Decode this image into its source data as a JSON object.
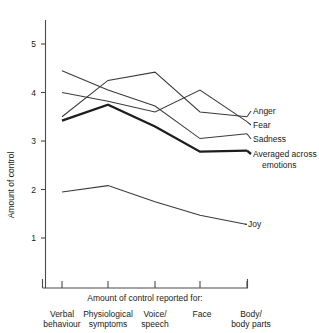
{
  "chart_data": {
    "type": "line",
    "title": "",
    "xlabel": "Amount of control reported for:",
    "ylabel": "Amount of control",
    "categories": [
      "Verbal behaviour",
      "Physiological symptoms",
      "Voice/ speech",
      "Face",
      "Body/ body parts"
    ],
    "category_lines": [
      [
        "Verbal",
        "behaviour"
      ],
      [
        "Physiological",
        "symptoms"
      ],
      [
        "Voice/",
        "speech"
      ],
      [
        "Face",
        ""
      ],
      [
        "Body/",
        "body parts"
      ]
    ],
    "yticks": [
      1,
      2,
      3,
      4,
      5
    ],
    "ytick_labels": [
      "1",
      "2",
      "3",
      "4",
      "5"
    ],
    "ylim": [
      0.55,
      5.6
    ],
    "grid": false,
    "legend_position": "right-inline",
    "series": [
      {
        "name": "Sadness",
        "values": [
          4.45,
          4.05,
          3.72,
          3.05,
          3.15
        ],
        "style": "thin"
      },
      {
        "name": "Anger",
        "values": [
          3.5,
          4.25,
          4.42,
          3.6,
          3.5
        ],
        "style": "thin"
      },
      {
        "name": "Fear",
        "values": [
          4.0,
          3.82,
          3.6,
          4.05,
          3.4
        ],
        "style": "thin"
      },
      {
        "name": "Averaged across emotions",
        "values": [
          3.42,
          3.75,
          3.3,
          2.78,
          2.8
        ],
        "style": "thick"
      },
      {
        "name": "Joy",
        "values": [
          1.95,
          2.08,
          1.75,
          1.47,
          1.28
        ],
        "style": "thin"
      }
    ],
    "labels": [
      {
        "text": "Anger",
        "series": "Anger"
      },
      {
        "text": "Fear",
        "series": "Fear"
      },
      {
        "text": "Sadness",
        "series": "Sadness"
      },
      {
        "text": "Averaged across",
        "series": "Averaged across emotions"
      },
      {
        "text": "emotions",
        "series": "Averaged across emotions"
      },
      {
        "text": "Joy",
        "series": "Joy"
      }
    ],
    "colors": {
      "line": "#3a3a3a",
      "thick_line": "#1d1d1d",
      "axis": "#4a4a4a",
      "text": "#1a1a1a",
      "background": "#ffffff"
    }
  }
}
